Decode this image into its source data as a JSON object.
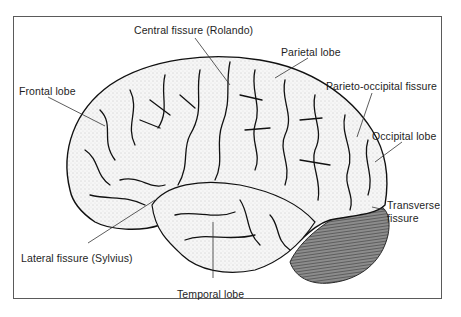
{
  "figure": {
    "frame_color": "#5a5a5a",
    "colors": {
      "cerebrum_fill": "#f4f4f4",
      "sulci_ink": "#111111",
      "cerebellum_fill": "#8a8a8a",
      "label_text": "#1e1e1e",
      "leader_line": "#333333"
    }
  },
  "labels": {
    "central_fissure": "Central fissure (Rolando)",
    "parietal_lobe": "Parietal lobe",
    "parieto_occipital_fissure": "Parieto-occipital fissure",
    "occipital_lobe": "Occipital lobe",
    "frontal_lobe": "Frontal lobe",
    "transverse_fissure_line1": "Transverse",
    "transverse_fissure_line2": "fissure",
    "lateral_fissure": "Lateral fissure (Sylvius)",
    "temporal_lobe": "Temporal lobe"
  }
}
